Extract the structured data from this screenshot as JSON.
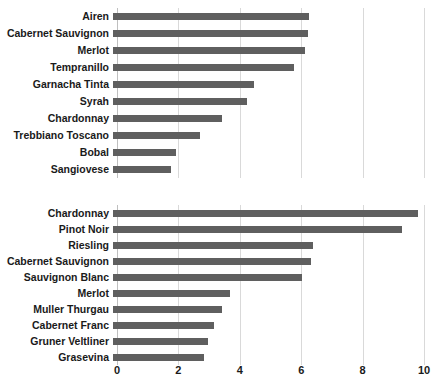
{
  "chart_data": [
    {
      "type": "bar",
      "orientation": "horizontal",
      "panel": "top",
      "title": "",
      "xlabel": "",
      "ylabel": "",
      "xlim": [
        0,
        10
      ],
      "xticks": [
        0,
        2,
        4,
        6,
        8,
        10
      ],
      "grid": true,
      "legend": "none",
      "bar_color": "#5f5f5f",
      "categories": [
        "Airen",
        "Cabernet Sauvignon",
        "Merlot",
        "Tempranillo",
        "Garnacha Tinta",
        "Syrah",
        "Chardonnay",
        "Trebbiano Toscano",
        "Bobal",
        "Sangiovese"
      ],
      "values": [
        6.4,
        6.35,
        6.25,
        5.9,
        4.6,
        4.35,
        3.55,
        2.85,
        2.05,
        1.9
      ]
    },
    {
      "type": "bar",
      "orientation": "horizontal",
      "panel": "bottom",
      "title": "",
      "xlabel": "",
      "ylabel": "",
      "xlim": [
        0,
        10
      ],
      "xticks": [
        0,
        2,
        4,
        6,
        8,
        10
      ],
      "grid": true,
      "legend": "none",
      "bar_color": "#5f5f5f",
      "categories": [
        "Chardonnay",
        "Pinot Noir",
        "Riesling",
        "Cabernet Sauvignon",
        "Sauvignon Blanc",
        "Merlot",
        "Muller Thurgau",
        "Cabernet Franc",
        "Gruner Veltliner",
        "Grasevina"
      ],
      "values": [
        9.95,
        9.4,
        6.5,
        6.45,
        6.15,
        3.8,
        3.55,
        3.3,
        3.1,
        2.95
      ]
    }
  ],
  "axis": {
    "tick_labels": [
      "0",
      "2",
      "4",
      "6",
      "8",
      "10"
    ]
  }
}
